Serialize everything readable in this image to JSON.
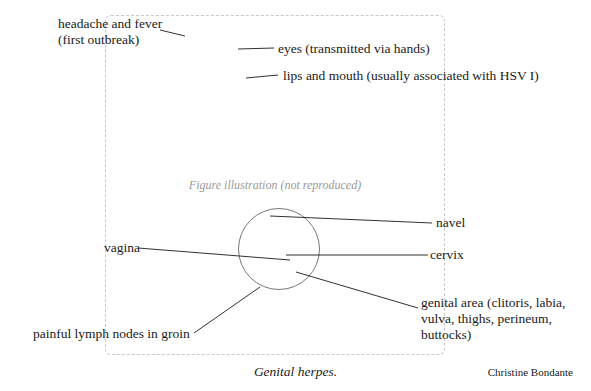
{
  "figure": {
    "placeholder_text": "Figure illustration (not reproduced)",
    "callout": "circle highlighting internal reproductive organs"
  },
  "labels": {
    "headache": {
      "line1": "headache and fever",
      "line2": "(first outbreak)"
    },
    "eyes": "eyes (transmitted via hands)",
    "lips": "lips and mouth (usually associated with HSV I)",
    "navel": "navel",
    "vagina": "vagina",
    "cervix": "cervix",
    "genital_area": {
      "line1": "genital area (clitoris, labia,",
      "line2": "vulva, thighs, perineum,",
      "line3": "buttocks)"
    },
    "lymph_nodes": "painful lymph nodes in groin"
  },
  "caption": "Genital herpes.",
  "credit": "Christine Bondante",
  "colors": {
    "ink": "#1a1a1a",
    "background": "#ffffff"
  }
}
